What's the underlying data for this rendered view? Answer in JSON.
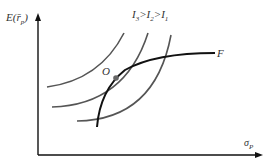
{
  "diagram": {
    "y_axis_label": "E(r̄",
    "y_axis_sub": "p",
    "x_axis_label": "σ",
    "x_axis_sub": "P",
    "legend_parts": [
      "I",
      "3",
      ">I",
      "2",
      ">I",
      "1"
    ],
    "frontier_label": "F",
    "optimum_label": "O",
    "colors": {
      "axis": "#111111",
      "indifference_curves": "#555555",
      "frontier": "#111111",
      "optimum_point": "#666666"
    },
    "curves": [
      {
        "name": "I3",
        "description": "highest indifference curve, leftmost"
      },
      {
        "name": "I2",
        "description": "middle indifference curve, tangent to F at O"
      },
      {
        "name": "I1",
        "description": "lowest indifference curve, rightmost"
      },
      {
        "name": "F",
        "description": "efficient frontier"
      }
    ]
  }
}
